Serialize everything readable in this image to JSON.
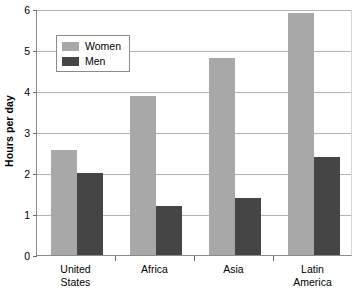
{
  "chart_data": {
    "type": "bar",
    "title": "",
    "xlabel": "",
    "ylabel": "Hours per day",
    "ylim": [
      0,
      6
    ],
    "yticks": [
      0,
      1,
      2,
      3,
      4,
      5,
      6
    ],
    "ytick_labels": [
      "0",
      "1",
      "2",
      "3",
      "4",
      "5",
      "6"
    ],
    "grid": true,
    "legend_position": "upper-left-inside",
    "categories": [
      "United States",
      "Africa",
      "Asia",
      "Latin America"
    ],
    "category_lines": [
      [
        "United",
        "States"
      ],
      [
        "Africa"
      ],
      [
        "Asia"
      ],
      [
        "Latin",
        "America"
      ]
    ],
    "series": [
      {
        "name": "Women",
        "color": "#a8a8a8",
        "values": [
          2.55,
          3.87,
          4.8,
          5.9
        ]
      },
      {
        "name": "Men",
        "color": "#454545",
        "values": [
          2.0,
          1.2,
          1.4,
          2.4
        ]
      }
    ]
  },
  "colors": {
    "women": "#a8a8a8",
    "men": "#454545",
    "gridline": "#b4b4b4",
    "axis": "#8a8a8a",
    "plot_background": "#ffffff"
  }
}
